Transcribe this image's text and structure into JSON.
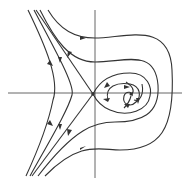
{
  "diagram": {
    "type": "phase-portrait",
    "title": "",
    "critical_points": [
      {
        "kind": "saddle",
        "x": 93,
        "y": 94
      },
      {
        "kind": "stable-spiral",
        "x": 131,
        "y": 94
      }
    ],
    "axes": {
      "horizontal": true,
      "vertical": true
    },
    "colors": {
      "stroke": "#333333",
      "background": "#ffffff"
    }
  }
}
